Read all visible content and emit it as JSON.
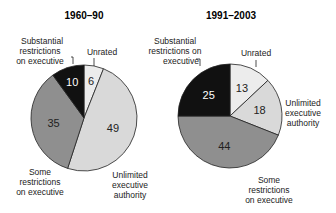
{
  "chart_data": [
    {
      "type": "pie",
      "title": "1960–90",
      "categories": [
        "Unrated",
        "Unlimited executive authority",
        "Some restrictions on executive",
        "Substantial restrictions on executive"
      ],
      "values": [
        6,
        49,
        35,
        10
      ],
      "colors": [
        "#ececec",
        "#d9d9d9",
        "#8f8f8f",
        "#111111"
      ],
      "labels": {
        "substantial": [
          "Substantial",
          "restrictions",
          "on executive"
        ],
        "unrated": [
          "Unrated"
        ],
        "some": [
          "Some",
          "restrictions",
          "on executive"
        ],
        "unlimited": [
          "Unlimited",
          "executive",
          "authority"
        ]
      }
    },
    {
      "type": "pie",
      "title": "1991–2003",
      "categories": [
        "Unrated",
        "Unlimited executive authority",
        "Some restrictions on executive",
        "Substantial restrictions on executive"
      ],
      "values": [
        13,
        18,
        44,
        25
      ],
      "colors": [
        "#ececec",
        "#d9d9d9",
        "#8f8f8f",
        "#111111"
      ],
      "labels": {
        "substantial": [
          "Substantial",
          "restrictions on",
          "executive"
        ],
        "unrated": [
          "Unrated"
        ],
        "some": [
          "Some",
          "restrictions",
          "on executive"
        ],
        "unlimited": [
          "Unlimited",
          "executive",
          "authority"
        ]
      }
    }
  ]
}
